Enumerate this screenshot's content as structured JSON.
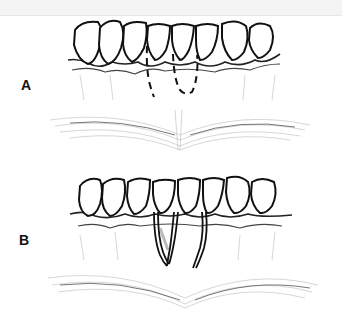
{
  "figure": {
    "panels": [
      {
        "label": "A",
        "description": "Dashed incision lines below teeth"
      },
      {
        "label": "B",
        "description": "Vertical releasing incisions"
      }
    ]
  }
}
